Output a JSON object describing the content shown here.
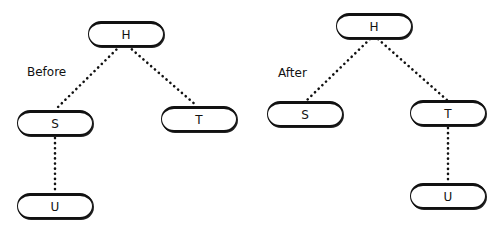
{
  "before": {
    "label": "Before",
    "nodes": {
      "H": "H",
      "S": "S",
      "T": "T",
      "U": "U"
    },
    "edges": [
      [
        "H",
        "S"
      ],
      [
        "H",
        "T"
      ],
      [
        "S",
        "U"
      ]
    ]
  },
  "after": {
    "label": "After",
    "nodes": {
      "H": "H",
      "S": "S",
      "T": "T",
      "U": "U"
    },
    "edges": [
      [
        "H",
        "S"
      ],
      [
        "H",
        "T"
      ],
      [
        "T",
        "U"
      ]
    ]
  },
  "style": {
    "edge_color": "#111111",
    "edge_style": "dotted"
  }
}
